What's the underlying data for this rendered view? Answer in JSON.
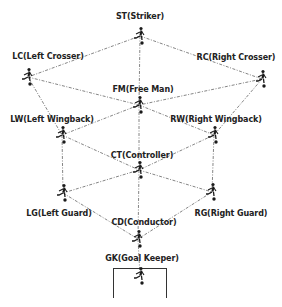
{
  "diagram": {
    "colors": {
      "edge": "#666666",
      "label": "#222222",
      "figure": "#1a1a1a",
      "goal": "#333333"
    },
    "nodes": [
      {
        "id": "ST",
        "label": "ST(Striker)",
        "x": 140,
        "y": 36,
        "lx": 140,
        "ly": 12
      },
      {
        "id": "LC",
        "label": "LC(Left Crosser)",
        "x": 28,
        "y": 77,
        "lx": 48,
        "ly": 52
      },
      {
        "id": "RC",
        "label": "RC(Right Crosser)",
        "x": 262,
        "y": 79,
        "lx": 236,
        "ly": 53
      },
      {
        "id": "FM",
        "label": "FM(Free Man)",
        "x": 139,
        "y": 105,
        "lx": 143,
        "ly": 85
      },
      {
        "id": "LW",
        "label": "LW(Left Wingback)",
        "x": 62,
        "y": 135,
        "lx": 52,
        "ly": 115
      },
      {
        "id": "RW",
        "label": "RW(Right Wingback)",
        "x": 214,
        "y": 135,
        "lx": 216,
        "ly": 115
      },
      {
        "id": "CT",
        "label": "CT(Controller)",
        "x": 139,
        "y": 170,
        "lx": 142,
        "ly": 151
      },
      {
        "id": "LG",
        "label": "LG(Left Guard)",
        "x": 63,
        "y": 193,
        "lx": 59,
        "ly": 209
      },
      {
        "id": "RG",
        "label": "RG(Right Guard)",
        "x": 212,
        "y": 192,
        "lx": 231,
        "ly": 209
      },
      {
        "id": "CD",
        "label": "CD(Conductor)",
        "x": 138,
        "y": 239,
        "lx": 144,
        "ly": 218
      },
      {
        "id": "GK",
        "label": "GK(Goal Keeper)",
        "x": 140,
        "y": 276,
        "lx": 142,
        "ly": 254
      }
    ],
    "edges": [
      [
        "ST",
        "LC"
      ],
      [
        "ST",
        "RC"
      ],
      [
        "ST",
        "FM"
      ],
      [
        "LC",
        "FM"
      ],
      [
        "RC",
        "FM"
      ],
      [
        "LC",
        "LW"
      ],
      [
        "RC",
        "RW"
      ],
      [
        "FM",
        "LW"
      ],
      [
        "FM",
        "RW"
      ],
      [
        "FM",
        "CT"
      ],
      [
        "LW",
        "CT"
      ],
      [
        "RW",
        "CT"
      ],
      [
        "LW",
        "LG"
      ],
      [
        "RW",
        "RG"
      ],
      [
        "CT",
        "LG"
      ],
      [
        "CT",
        "RG"
      ],
      [
        "CT",
        "CD"
      ],
      [
        "LG",
        "CD"
      ],
      [
        "RG",
        "CD"
      ],
      [
        "CD",
        "GK"
      ]
    ]
  }
}
